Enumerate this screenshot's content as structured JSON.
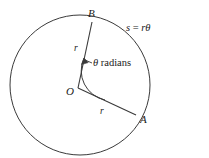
{
  "figure": {
    "type": "circle-sector-radian-diagram",
    "background_color": "#ffffff",
    "stroke_color": "#333333",
    "text_color": "#1a1a1a",
    "labels": {
      "point_b": "B",
      "point_o": "O",
      "point_a": "A",
      "radius_ob": "r",
      "radius_oa": "r",
      "angle_symbol": "θ",
      "angle_unit": " radians",
      "arc_length_lhs": "s",
      "arc_length_eq": " = ",
      "arc_length_rhs": "rθ"
    },
    "geometry": {
      "circle_center_x": 80,
      "circle_center_y": 85,
      "circle_radius": 70,
      "vertex_x": 78,
      "vertex_y": 88,
      "point_b_x": 92,
      "point_b_y": 22,
      "point_a_x": 136,
      "point_a_y": 115,
      "angle_arc_radius": 30
    }
  }
}
